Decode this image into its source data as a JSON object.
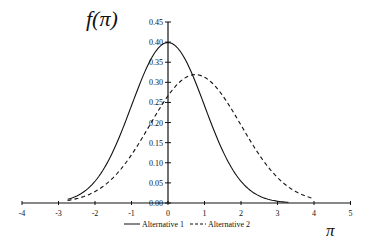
{
  "chart_data": {
    "type": "line",
    "title": "",
    "ylabel": "f(π)",
    "xlabel": "π",
    "xlim": [
      -4,
      5
    ],
    "ylim": [
      0,
      0.45
    ],
    "x_ticks": [
      "-4",
      "-3",
      "-2",
      "-1",
      "0",
      "1",
      "2",
      "3",
      "4",
      "5"
    ],
    "y_ticks": [
      "0.00",
      "0.05",
      "0.10",
      "0.15",
      "0.20",
      "0.25",
      "0.30",
      "0.35",
      "0.40",
      "0.45"
    ],
    "grid": false,
    "legend_position": "bottom",
    "series": [
      {
        "name": "Alternative 1",
        "style": "solid",
        "distribution": "normal",
        "mean": 0,
        "sd": 1,
        "x_range": [
          -2.75,
          3.3
        ],
        "x": [
          -2.75,
          -2,
          -1.5,
          -1,
          -0.5,
          0,
          0.5,
          1,
          1.5,
          2,
          2.5,
          3,
          3.3
        ],
        "values": [
          0.009,
          0.054,
          0.13,
          0.242,
          0.352,
          0.399,
          0.352,
          0.242,
          0.13,
          0.054,
          0.018,
          0.004,
          0.002
        ]
      },
      {
        "name": "Alternative 2",
        "style": "dashed",
        "distribution": "normal",
        "mean": 0.75,
        "sd": 1.25,
        "x_range": [
          -2.75,
          4.0
        ],
        "x": [
          -2.75,
          -2,
          -1,
          0,
          0.75,
          1,
          2,
          3,
          4
        ],
        "values": [
          0.006,
          0.024,
          0.119,
          0.268,
          0.319,
          0.313,
          0.209,
          0.063,
          0.013
        ]
      }
    ]
  },
  "labels": {
    "y_axis_title": "f(π)",
    "x_axis_title": "π",
    "legend_1": "Alternative 1",
    "legend_2": "Alternative 2"
  }
}
